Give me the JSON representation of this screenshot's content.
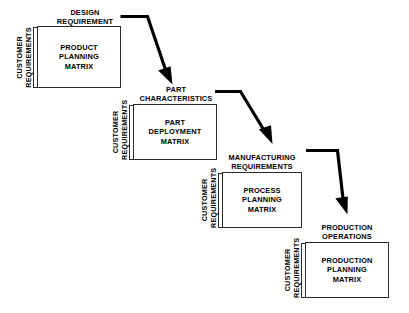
{
  "diagram": {
    "background_color": "#ffffff",
    "line_color": "#2b2b2b",
    "arrow_color": "#000000",
    "text_color": "#000000",
    "side_label": {
      "line1": "CUSTOMER",
      "line2": "REQUIREMENTS"
    },
    "phases": [
      {
        "id": "product-planning",
        "header_line1": "DESIGN",
        "header_line2": "REQUIREMENT",
        "matrix_line1": "PRODUCT",
        "matrix_line2": "PLANNING",
        "matrix_line3": "MATRIX",
        "side_line1": "CUSTOMER",
        "side_line2": "REQUIREMENTS"
      },
      {
        "id": "part-deployment",
        "header_line1": "PART",
        "header_line2": "CHARACTERISTICS",
        "matrix_line1": "PART",
        "matrix_line2": "DEPLOYMENT",
        "matrix_line3": "MATRIX",
        "side_line1": "CUSTOMER",
        "side_line2": "REQUIREMENTS"
      },
      {
        "id": "process-planning",
        "header_line1": "MANUFACTURING",
        "header_line2": "REQUIREMENTS",
        "matrix_line1": "PROCESS",
        "matrix_line2": "PLANNING",
        "matrix_line3": "MATRIX",
        "side_line1": "CUSTOMER",
        "side_line2": "REQUIREMENTS"
      },
      {
        "id": "production-planning",
        "header_line1": "PRODUCTION",
        "header_line2": "OPERATIONS",
        "matrix_line1": "PRODUCTION",
        "matrix_line2": "PLANNING",
        "matrix_line3": "MATRIX",
        "side_line1": "CUSTOMER",
        "side_line2": "REQUIREMENTS"
      }
    ],
    "connectors": [
      {
        "id": "connector-1",
        "from": "product-planning",
        "to": "part-deployment"
      },
      {
        "id": "connector-2",
        "from": "part-deployment",
        "to": "process-planning"
      },
      {
        "id": "connector-3",
        "from": "process-planning",
        "to": "production-planning"
      }
    ]
  }
}
